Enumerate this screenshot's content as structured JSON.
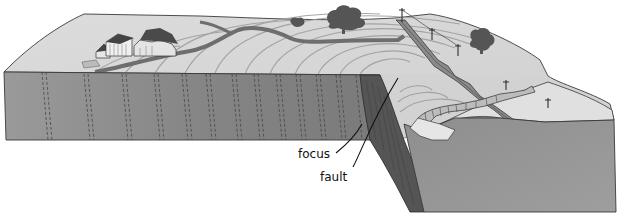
{
  "diagram": {
    "type": "block-diagram",
    "labels": [
      {
        "id": "focus",
        "text": "focus",
        "x": 298,
        "y": 148
      },
      {
        "id": "fault",
        "text": "fault",
        "x": 320,
        "y": 171
      }
    ],
    "features": [
      "farmhouse-buildings",
      "trees",
      "winding-road",
      "railway-track",
      "utility-poles",
      "fault-scarp",
      "seismic-wave-rings",
      "dashed-rock-strata"
    ],
    "colors": {
      "background": "#ffffff",
      "surface": "#d9d9d9",
      "block_front": "#8c8c8c",
      "block_side_dark": "#5a5a5a",
      "outline": "#3a3a3a",
      "road": "#7a7a7a",
      "tree": "#555555",
      "leader_line": "#111111"
    }
  }
}
